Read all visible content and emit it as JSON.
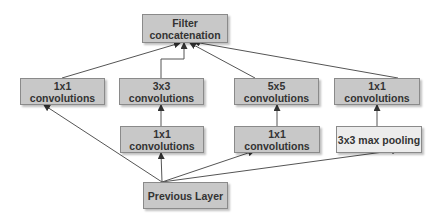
{
  "diagram": {
    "nodes": {
      "concat": "Filter\nconcatenation",
      "concat_line1": "Filter",
      "concat_line2": "concatenation",
      "top_1x1": "1x1 convolutions",
      "top_3x3": "3x3 convolutions",
      "top_5x5": "5x5 convolutions",
      "top_1x1_pool": "1x1 convolutions",
      "mid_1x1_a": "1x1 convolutions",
      "mid_1x1_b": "1x1 convolutions",
      "mid_pool": "3x3 max pooling",
      "prev": "Previous Layer"
    },
    "edges": [
      [
        "prev",
        "top_1x1"
      ],
      [
        "prev",
        "mid_1x1_a"
      ],
      [
        "prev",
        "mid_1x1_b"
      ],
      [
        "prev",
        "mid_pool"
      ],
      [
        "mid_1x1_a",
        "top_3x3"
      ],
      [
        "mid_1x1_b",
        "top_5x5"
      ],
      [
        "mid_pool",
        "top_1x1_pool"
      ],
      [
        "top_1x1",
        "concat"
      ],
      [
        "top_3x3",
        "concat"
      ],
      [
        "top_5x5",
        "concat"
      ],
      [
        "top_1x1_pool",
        "concat"
      ]
    ],
    "colors": {
      "node_fill": "#c8c8c8",
      "pool_fill": "#ececec",
      "edge": "#555555"
    }
  }
}
